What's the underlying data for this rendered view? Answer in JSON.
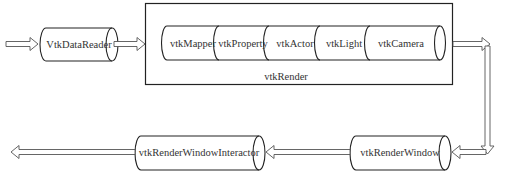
{
  "diagram": {
    "nodes": {
      "data_reader": "VtkDataReader",
      "render_container": "vtkRender",
      "render_window": "vtkRenderWindow",
      "interactor": "vtkRenderWindowInteractor"
    },
    "render_components": [
      "vtkMapper",
      "vtkProperty",
      "vtkActor",
      "vtkLight",
      "vtkCamera"
    ],
    "flow": [
      {
        "from": "input",
        "to": "VtkDataReader"
      },
      {
        "from": "VtkDataReader",
        "to": "vtkRender"
      },
      {
        "from": "vtkRender",
        "to": "vtkRenderWindow"
      },
      {
        "from": "vtkRenderWindow",
        "to": "vtkRenderWindowInteractor"
      },
      {
        "from": "vtkRenderWindowInteractor",
        "to": "output"
      }
    ]
  }
}
